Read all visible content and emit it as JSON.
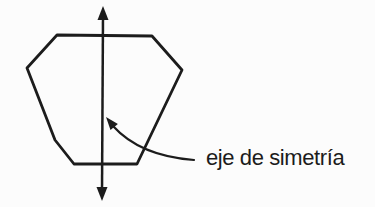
{
  "figure": {
    "label": {
      "text": "eje de simetría"
    },
    "colors": {
      "ink": "#1c1c1c",
      "background": "#fcfcfc"
    },
    "geometry": {
      "polygon_points": "57,35 152,36 182,70 137,164 74,164 55,140 27,68",
      "axis": {
        "line": {
          "x1": "103",
          "y1": "16",
          "x2": "102",
          "y2": "191"
        },
        "arrow_top_points": "103,6 97.5,20 108.5,20",
        "arrow_bottom_points": "102,201 96.5,187 107.5,187"
      },
      "leader": {
        "path": "M 194 160 Q 140 156 113 126",
        "arrowhead_points": "106,117 110.5,130 117.9,124"
      }
    }
  }
}
